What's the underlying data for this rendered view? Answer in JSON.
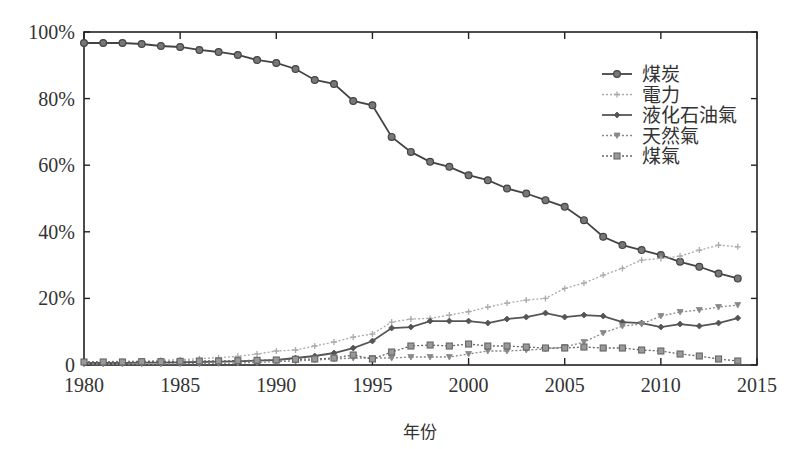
{
  "chart_data": {
    "type": "line",
    "title": "",
    "xlabel": "年份",
    "ylabel": "",
    "xlim": [
      1980,
      2015
    ],
    "ylim": [
      0,
      100
    ],
    "x_ticks": [
      1980,
      1985,
      1990,
      1995,
      2000,
      2005,
      2010,
      2015
    ],
    "x_tick_labels": [
      "1980",
      "1985",
      "1990",
      "1995",
      "2000",
      "2005",
      "2010",
      "2015"
    ],
    "y_ticks": [
      0,
      20,
      40,
      60,
      80,
      100
    ],
    "y_tick_labels": [
      "0",
      "20%",
      "40%",
      "60%",
      "80%",
      "100%"
    ],
    "grid": false,
    "legend_position": "upper right (inside)",
    "x": [
      1980,
      1981,
      1982,
      1983,
      1984,
      1985,
      1986,
      1987,
      1988,
      1989,
      1990,
      1991,
      1992,
      1993,
      1994,
      1995,
      1996,
      1997,
      1998,
      1999,
      2000,
      2001,
      2002,
      2003,
      2004,
      2005,
      2006,
      2007,
      2008,
      2009,
      2010,
      2011,
      2012,
      2013,
      2014
    ],
    "series": [
      {
        "name": "煤炭",
        "marker": "circle",
        "line": "solid",
        "color": "#444444",
        "values": [
          96.7,
          96.7,
          96.7,
          96.4,
          95.8,
          95.5,
          94.6,
          94.0,
          93.1,
          91.6,
          90.7,
          88.9,
          85.6,
          84.4,
          79.3,
          78.0,
          68.5,
          64.0,
          61.0,
          59.5,
          57.0,
          55.5,
          53.0,
          51.5,
          49.5,
          47.5,
          43.5,
          38.5,
          36.0,
          34.5,
          33.0,
          31.0,
          29.5,
          27.5,
          26.0
        ]
      },
      {
        "name": "電力",
        "marker": "plus",
        "line": "dotted",
        "color": "#aaaaaa",
        "values": [
          0.9,
          1.0,
          1.1,
          1.2,
          1.4,
          1.6,
          1.9,
          2.2,
          2.6,
          3.3,
          4.2,
          4.5,
          5.7,
          6.9,
          8.4,
          9.3,
          12.9,
          13.8,
          14.0,
          15.0,
          16.0,
          17.4,
          18.6,
          19.5,
          20.0,
          23.0,
          24.6,
          27.0,
          29.0,
          31.5,
          32.0,
          32.7,
          34.5,
          36.0,
          35.5
        ]
      },
      {
        "name": "液化石油氣",
        "marker": "diamond",
        "line": "solid",
        "color": "#555555",
        "values": [
          0.6,
          0.6,
          0.6,
          0.7,
          0.7,
          0.8,
          0.9,
          1.0,
          1.1,
          1.3,
          1.5,
          2.1,
          2.7,
          3.6,
          5.1,
          7.2,
          11.1,
          11.4,
          13.2,
          13.2,
          13.2,
          12.6,
          13.8,
          14.4,
          15.6,
          14.4,
          15.0,
          14.7,
          12.9,
          12.6,
          11.4,
          12.3,
          11.7,
          12.6,
          14.1
        ]
      },
      {
        "name": "天然氣",
        "marker": "triangle",
        "line": "dotted",
        "color": "#888888",
        "values": [
          0.3,
          0.3,
          0.3,
          0.3,
          0.3,
          0.4,
          0.4,
          0.5,
          0.6,
          0.8,
          1.0,
          1.2,
          1.5,
          1.8,
          2.1,
          2.1,
          2.1,
          2.4,
          2.4,
          2.4,
          3.3,
          4.2,
          4.2,
          4.5,
          4.8,
          5.4,
          6.9,
          9.6,
          11.7,
          12.3,
          14.7,
          15.9,
          16.5,
          17.4,
          18.0
        ]
      },
      {
        "name": "煤氣",
        "marker": "square",
        "line": "dotted",
        "color": "#666666",
        "values": [
          0.9,
          0.9,
          0.9,
          1.0,
          1.0,
          1.1,
          1.2,
          1.2,
          1.3,
          1.4,
          1.5,
          1.7,
          1.8,
          2.1,
          3.0,
          1.8,
          3.9,
          5.7,
          6.0,
          5.7,
          6.3,
          5.7,
          5.7,
          5.4,
          5.1,
          5.1,
          5.4,
          5.1,
          5.1,
          4.5,
          4.2,
          3.3,
          2.7,
          1.8,
          1.2
        ]
      }
    ]
  },
  "legend": {
    "items": [
      "煤炭",
      "電力",
      "液化石油氣",
      "天然氣",
      "煤氣"
    ]
  },
  "axes": {
    "xlabel": "年份"
  }
}
